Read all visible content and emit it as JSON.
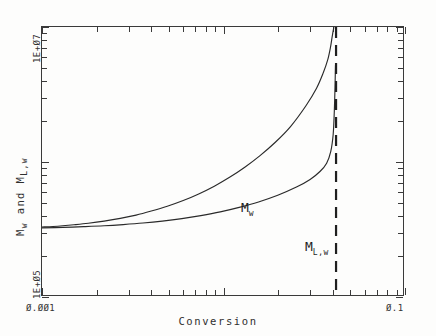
{
  "chart_data": {
    "type": "line",
    "title": "",
    "xlabel": "Conversion",
    "ylabel": "M_w and M_L,w",
    "xscale": "log",
    "yscale": "log",
    "xlim": [
      0.001,
      0.1
    ],
    "ylim": [
      100000,
      10000000
    ],
    "xtick_labels": [
      "0.001",
      "0.1"
    ],
    "ytick_labels": [
      "1E+05",
      "1E+07"
    ],
    "grid": false,
    "legend": "inline-annotations",
    "annotations": [
      {
        "text": "M",
        "subscript": "w",
        "x": 0.0135,
        "y": 900000
      },
      {
        "text": "M",
        "subscript": "L,w",
        "x": 0.0345,
        "y": 520000
      }
    ],
    "series": [
      {
        "name": "M_w",
        "label_base": "M",
        "label_sub": "w",
        "x": [
          0.001,
          0.00115,
          0.0013,
          0.0015,
          0.0018,
          0.0022,
          0.0027,
          0.0033,
          0.004,
          0.0049,
          0.006,
          0.0073,
          0.0089,
          0.0108,
          0.0131,
          0.0159,
          0.0193,
          0.0234,
          0.0284,
          0.0325,
          0.0355,
          0.0375,
          0.0388,
          0.0396,
          0.0401,
          0.0404,
          0.0406
        ],
        "y": [
          330000,
          333000,
          337000,
          343000,
          352000,
          365000,
          382000,
          404000,
          433000,
          470000,
          518000,
          580000,
          662000,
          770000,
          915000,
          1115000,
          1400000,
          1830000,
          2600000,
          3500000,
          4600000,
          5700000,
          7000000,
          8300000,
          9200000,
          9700000,
          10000000
        ]
      },
      {
        "name": "M_L,w",
        "label_base": "M",
        "label_sub": "L,w",
        "x": [
          0.001,
          0.0013,
          0.0017,
          0.0022,
          0.0028,
          0.0036,
          0.0046,
          0.0059,
          0.0075,
          0.0096,
          0.0122,
          0.0156,
          0.0199,
          0.0254,
          0.03,
          0.034,
          0.037,
          0.039,
          0.0402,
          0.0408,
          0.0412,
          0.0414
        ],
        "y": [
          325000,
          328000,
          332000,
          337000,
          344000,
          353000,
          365000,
          381000,
          401000,
          427000,
          461000,
          506000,
          567000,
          655000,
          742000,
          850000,
          980000,
          1200000,
          1600000,
          2400000,
          3800000,
          5200000
        ]
      }
    ],
    "asymptote": {
      "name": "gel-point-asymptote",
      "style": "dashed",
      "x": 0.0417,
      "orientation": "vertical"
    },
    "x_minor_ticks_per_decade": [
      2,
      3,
      4,
      5,
      6,
      7,
      8,
      9
    ],
    "y_minor_ticks_per_decade": [
      2,
      3,
      4,
      5,
      6,
      7,
      8,
      9
    ]
  },
  "axes": {
    "x_title": "Conversion",
    "y_title": "M  and M",
    "y_title_sub1": "w",
    "y_title_sub2": "L,w",
    "y_title_full": "M_w and M_L,w",
    "x_min_label": "Ø.ØØ1",
    "x_max_label": "Ø.1",
    "y_min_label": "1E+Ø5",
    "y_max_label": "1E+Ø7"
  },
  "annotations": {
    "mw_base": "M",
    "mw_sub": "w",
    "mlw_base": "M",
    "mlw_sub": "L,w"
  },
  "colors": {
    "ink": "#2b2b2b",
    "frame": "#3a3a3a",
    "curve": "#2a2a2a",
    "asymptote": "#1f1f1f",
    "background": "#fdfdfc"
  }
}
